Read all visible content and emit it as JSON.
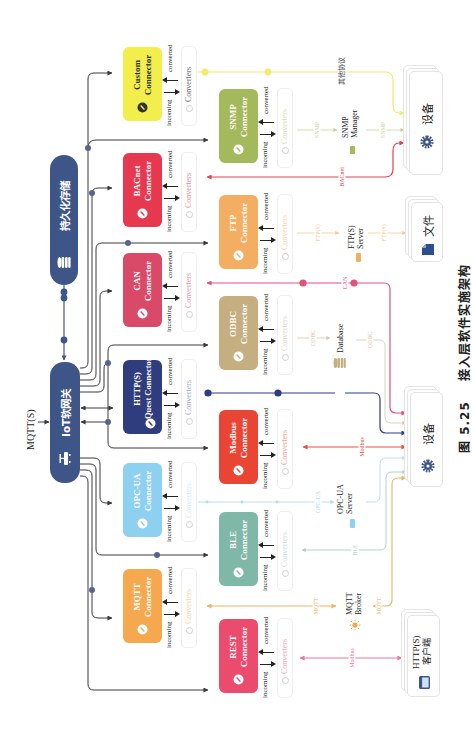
{
  "figure": {
    "number": "图 5.25",
    "title": "接入层软件实施架构"
  },
  "colors": {
    "bus": "#3A3A3A",
    "node": "#3E5588",
    "bus_dot": "#56648F"
  },
  "gateway": {
    "label": "IoT软网关",
    "input_protocol": "MQTT(S)",
    "icon": "router-icon",
    "color": "#3E5588"
  },
  "storage": {
    "label": "持久化存储",
    "icon": "database-icon",
    "color": "#3E5588"
  },
  "connector_labels": {
    "incoming": "incoming",
    "converted": "converted",
    "converters": "Converters"
  },
  "connectors": [
    {
      "id": "mqtt",
      "line1": "MQTT",
      "line2": "Connector",
      "color": "#F5A84E",
      "text_color": "#ffffff",
      "icon_bg": "#ffffff",
      "converters_color": "#F3D7A6"
    },
    {
      "id": "opcua",
      "line1": "OPC-UA",
      "line2": "Connector",
      "color": "#8ED0F0",
      "text_color": "#ffffff",
      "icon_bg": "#ffffff",
      "converters_color": "#D3ECF7"
    },
    {
      "id": "http",
      "line1": "HTTP(S)",
      "line2": "Quest Connector",
      "color": "#2F3C7E",
      "text_color": "#ffffff",
      "icon_bg": "#ffffff",
      "converters_color": "#A3A8BC"
    },
    {
      "id": "can",
      "line1": "CAN",
      "line2": "Connector",
      "color": "#D84A68",
      "text_color": "#ffffff",
      "icon_bg": "#ffffff",
      "converters_color": "#E994A8"
    },
    {
      "id": "bacnet",
      "line1": "BACnet",
      "line2": "Connector",
      "color": "#E63950",
      "text_color": "#ffffff",
      "icon_bg": "#ffffff",
      "converters_color": "#EE8C99"
    },
    {
      "id": "custom",
      "line1": "Custom",
      "line2": "Connector",
      "color": "#F2EE4C",
      "text_color": "#2A2A2A",
      "icon_bg": "#333333",
      "converters_color": "#666666"
    },
    {
      "id": "rest",
      "line1": "REST",
      "line2": "Connector",
      "color": "#EB4B6D",
      "text_color": "#ffffff",
      "icon_bg": "#ffffff",
      "converters_color": "#F1A2B3"
    },
    {
      "id": "ble",
      "line1": "BLE",
      "line2": "Connector",
      "color": "#7FB8A6",
      "text_color": "#ffffff",
      "icon_bg": "#ffffff",
      "converters_color": "#CBE0D9"
    },
    {
      "id": "modbus",
      "line1": "Modbus",
      "line2": "Connector",
      "color": "#EA4534",
      "text_color": "#ffffff",
      "icon_bg": "#ffffff",
      "converters_color": "#F19A8E"
    },
    {
      "id": "odbc",
      "line1": "ODBC",
      "line2": "Connector",
      "color": "#C5AE80",
      "text_color": "#ffffff",
      "icon_bg": "#ffffff",
      "converters_color": "#E3D8C2"
    },
    {
      "id": "ftp",
      "line1": "FTP",
      "line2": "Connector",
      "color": "#F4AE62",
      "text_color": "#ffffff",
      "icon_bg": "#ffffff",
      "converters_color": "#F6D3AB"
    },
    {
      "id": "snmp",
      "line1": "SNMP",
      "line2": "Connector",
      "color": "#A4B85C",
      "text_color": "#ffffff",
      "icon_bg": "#ffffff",
      "converters_color": "#D7DFB3"
    }
  ],
  "external_systems": [
    {
      "id": "snmp-manager",
      "line1": "SNMP",
      "line2": "Manager",
      "icon_color": "#A4B85C"
    },
    {
      "id": "ftp-server",
      "line1": "FTP(S)",
      "line2": "Server",
      "icon_color": "#F4AE62"
    },
    {
      "id": "database",
      "line1": "Database",
      "icon_color": "#C5AE80"
    },
    {
      "id": "opcua-server",
      "line1": "OPC-UA",
      "line2": "Server",
      "icon_color": "#8ED0F0"
    },
    {
      "id": "mqtt-broker",
      "line1": "MQTT",
      "line2": "Broker",
      "icon_color": "#F5A84E"
    }
  ],
  "endpoints": [
    {
      "id": "device-top",
      "label": "设备",
      "icon": "gear-icon"
    },
    {
      "id": "file",
      "label": "文件",
      "icon": "document-icon"
    },
    {
      "id": "device-bottom",
      "label": "设备",
      "icon": "gear-icon"
    },
    {
      "id": "http-client",
      "line1": "HTTP(S)",
      "line2": "客户端",
      "icon": "browser-icon"
    }
  ],
  "links": {
    "other": {
      "label": "其他协议",
      "color": "#F2EC6A",
      "label_color": "#444444"
    },
    "bacnet": {
      "label": "BACnet",
      "color": "#E8404F"
    },
    "snmp": {
      "label": "SNMP",
      "color": "#C9D49A"
    },
    "ftp": {
      "label": "FTP(S)",
      "color": "#F5C994"
    },
    "can": {
      "label": "CAN",
      "color": "#E0527A"
    },
    "odbc": {
      "label": "ODBC",
      "color": "#D8C9A6"
    },
    "http": {
      "color": "#2F3C7E"
    },
    "modbus": {
      "label": "Modbus",
      "color": "#E8503F"
    },
    "opcua": {
      "label": "OPC-UA",
      "color": "#B3DAEC"
    },
    "ble": {
      "label": "BLE",
      "color": "#A9CFC3"
    },
    "mqtt": {
      "label": "MQTT",
      "color": "#F3B25E"
    },
    "rest": {
      "label": "Modbus",
      "color": "#E8799A"
    }
  }
}
